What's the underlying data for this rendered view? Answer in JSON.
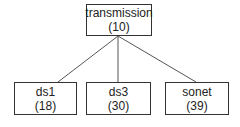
{
  "diagram": {
    "type": "tree",
    "root": {
      "label": "transmission",
      "count": "(10)"
    },
    "children": [
      {
        "label": "ds1",
        "count": "(18)"
      },
      {
        "label": "ds3",
        "count": "(30)"
      },
      {
        "label": "sonet",
        "count": "(39)"
      }
    ],
    "colors": {
      "line": "#555555",
      "border": "#333333",
      "background": "#ffffff"
    }
  }
}
